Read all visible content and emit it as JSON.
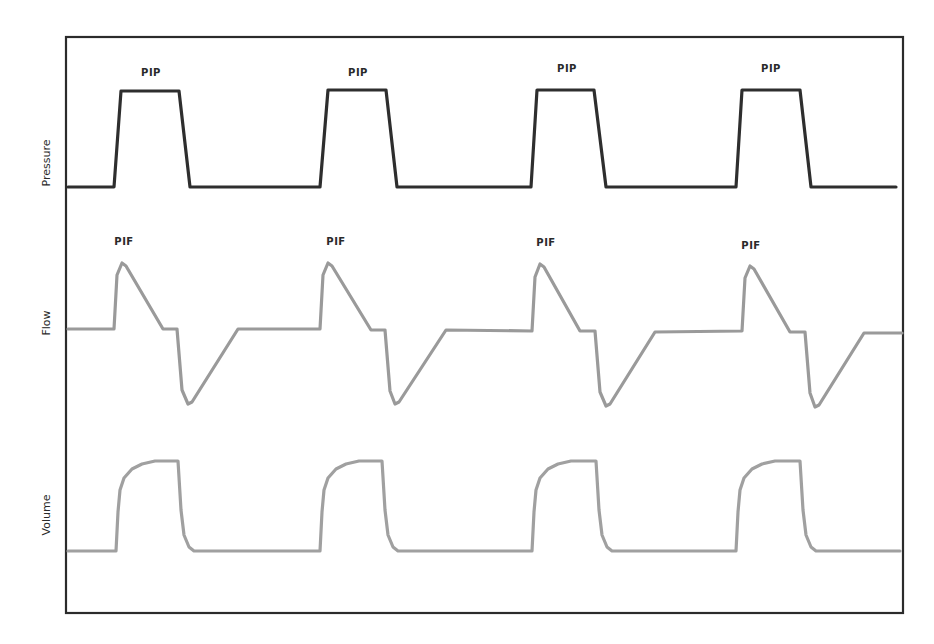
{
  "chart_data": {
    "type": "line",
    "title": "",
    "xlabel": "",
    "grid": false,
    "legend": "none",
    "frame": {
      "x1": 66,
      "y1": 37,
      "x2": 903,
      "y2": 613,
      "color": "#2b2b2b"
    },
    "series": [
      {
        "name": "Pressure",
        "ylabel": "Pressure",
        "color": "#2e2e2e",
        "stroke_width": 3.2,
        "label_pos": {
          "x": 47,
          "y": 163
        },
        "annotation": "PIP",
        "annotations": [
          {
            "text": "PIP",
            "x": 151,
            "y": 76
          },
          {
            "text": "PIP",
            "x": 358,
            "y": 76
          },
          {
            "text": "PIP",
            "x": 567,
            "y": 72
          },
          {
            "text": "PIP",
            "x": 771,
            "y": 72
          }
        ],
        "points": [
          [
            68,
            187
          ],
          [
            114,
            187
          ],
          [
            121,
            91
          ],
          [
            179,
            91
          ],
          [
            190,
            187
          ],
          [
            320,
            187
          ],
          [
            328,
            90
          ],
          [
            386,
            90
          ],
          [
            397,
            187
          ],
          [
            531,
            187
          ],
          [
            537,
            90
          ],
          [
            594,
            90
          ],
          [
            606,
            187
          ],
          [
            736,
            187
          ],
          [
            742,
            90
          ],
          [
            800,
            90
          ],
          [
            811,
            187
          ],
          [
            896,
            187
          ]
        ]
      },
      {
        "name": "Flow",
        "ylabel": "Flow",
        "color": "#9a9a9a",
        "stroke_width": 3.2,
        "label_pos": {
          "x": 47,
          "y": 323
        },
        "annotation": "PIF",
        "annotations": [
          {
            "text": "PIF",
            "x": 124,
            "y": 245
          },
          {
            "text": "PIF",
            "x": 336,
            "y": 245
          },
          {
            "text": "PIF",
            "x": 546,
            "y": 246
          },
          {
            "text": "PIF",
            "x": 751,
            "y": 249
          }
        ],
        "points": [
          [
            68,
            329
          ],
          [
            114,
            329
          ],
          [
            117,
            275
          ],
          [
            122,
            263
          ],
          [
            126,
            266
          ],
          [
            163,
            329
          ],
          [
            177,
            329
          ],
          [
            182,
            390
          ],
          [
            188,
            404
          ],
          [
            192,
            402
          ],
          [
            238,
            329
          ],
          [
            320,
            329
          ],
          [
            323,
            275
          ],
          [
            328,
            263
          ],
          [
            332,
            266
          ],
          [
            371,
            330
          ],
          [
            385,
            330
          ],
          [
            390,
            391
          ],
          [
            395,
            404
          ],
          [
            399,
            402
          ],
          [
            446,
            330
          ],
          [
            532,
            331
          ],
          [
            535,
            277
          ],
          [
            540,
            264
          ],
          [
            544,
            267
          ],
          [
            580,
            331
          ],
          [
            595,
            331
          ],
          [
            600,
            392
          ],
          [
            606,
            406
          ],
          [
            610,
            404
          ],
          [
            655,
            332
          ],
          [
            742,
            331
          ],
          [
            745,
            278
          ],
          [
            750,
            266
          ],
          [
            754,
            269
          ],
          [
            790,
            332
          ],
          [
            805,
            332
          ],
          [
            810,
            393
          ],
          [
            815,
            407
          ],
          [
            819,
            405
          ],
          [
            864,
            333
          ],
          [
            902,
            333
          ]
        ]
      },
      {
        "name": "Volume",
        "ylabel": "Volume",
        "color": "#a0a0a0",
        "stroke_width": 3.2,
        "label_pos": {
          "x": 47,
          "y": 515
        },
        "points": [
          [
            68,
            551
          ],
          [
            116,
            551
          ],
          [
            118,
            512
          ],
          [
            120,
            490
          ],
          [
            124,
            478
          ],
          [
            132,
            469
          ],
          [
            142,
            464
          ],
          [
            155,
            461
          ],
          [
            178,
            461
          ],
          [
            181,
            510
          ],
          [
            184,
            535
          ],
          [
            189,
            547
          ],
          [
            194,
            551
          ],
          [
            320,
            551
          ],
          [
            322,
            512
          ],
          [
            324,
            490
          ],
          [
            328,
            478
          ],
          [
            336,
            469
          ],
          [
            346,
            464
          ],
          [
            359,
            461
          ],
          [
            382,
            461
          ],
          [
            385,
            510
          ],
          [
            388,
            535
          ],
          [
            393,
            547
          ],
          [
            398,
            551
          ],
          [
            532,
            551
          ],
          [
            534,
            512
          ],
          [
            536,
            490
          ],
          [
            540,
            478
          ],
          [
            548,
            469
          ],
          [
            558,
            464
          ],
          [
            571,
            461
          ],
          [
            596,
            461
          ],
          [
            599,
            510
          ],
          [
            602,
            535
          ],
          [
            607,
            547
          ],
          [
            612,
            551
          ],
          [
            736,
            551
          ],
          [
            738,
            512
          ],
          [
            740,
            490
          ],
          [
            744,
            478
          ],
          [
            752,
            469
          ],
          [
            762,
            464
          ],
          [
            775,
            461
          ],
          [
            800,
            461
          ],
          [
            803,
            510
          ],
          [
            806,
            535
          ],
          [
            811,
            547
          ],
          [
            816,
            551
          ],
          [
            900,
            551
          ]
        ]
      }
    ]
  }
}
